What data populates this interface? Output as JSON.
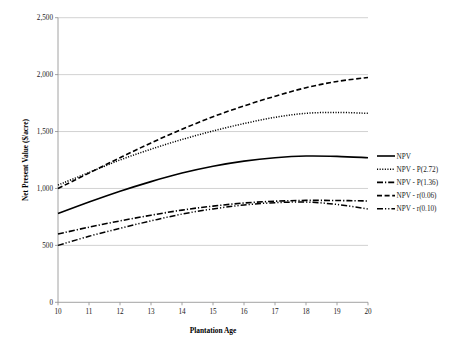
{
  "chart_data": {
    "type": "line",
    "title": "",
    "xlabel": "Plantation Age",
    "ylabel": "Net Present Value ($/acre)",
    "xlim": [
      10,
      20
    ],
    "ylim": [
      0,
      2500
    ],
    "x": [
      10,
      11,
      12,
      13,
      14,
      15,
      16,
      17,
      18,
      19,
      20
    ],
    "xticks": [
      "10",
      "11",
      "12",
      "13",
      "14",
      "15",
      "16",
      "17",
      "18",
      "19",
      "20"
    ],
    "yticks": [
      "0",
      "500",
      "1,000",
      "1,500",
      "2,000",
      "2,500"
    ],
    "ytick_values": [
      0,
      500,
      1000,
      1500,
      2000,
      2500
    ],
    "grid": "horizontal",
    "legend_position": "right",
    "series": [
      {
        "name": "NPV",
        "style": "solid",
        "values": [
          780,
          880,
          975,
          1060,
          1135,
          1195,
          1240,
          1270,
          1285,
          1282,
          1270
        ]
      },
      {
        "name": "NPV - P(2.72)",
        "style": "dotted",
        "values": [
          1030,
          1140,
          1250,
          1345,
          1430,
          1505,
          1570,
          1625,
          1660,
          1668,
          1660
        ]
      },
      {
        "name": "NPV - P(1.36)",
        "style": "dash-dot",
        "values": [
          600,
          660,
          715,
          765,
          810,
          845,
          872,
          888,
          895,
          894,
          890
        ]
      },
      {
        "name": "NPV - r(0.06)",
        "style": "dashed",
        "values": [
          1000,
          1135,
          1270,
          1400,
          1520,
          1630,
          1725,
          1810,
          1885,
          1940,
          1975
        ]
      },
      {
        "name": "NPV - r(0.10)",
        "style": "dash-dot-dot",
        "values": [
          500,
          580,
          650,
          715,
          775,
          820,
          855,
          875,
          880,
          860,
          820
        ]
      }
    ]
  },
  "legend": {
    "entries": [
      {
        "label": "NPV"
      },
      {
        "label": "NPV - P(2.72)"
      },
      {
        "label": "NPV - P(1.36)"
      },
      {
        "label": "NPV - r(0.06)"
      },
      {
        "label": "NPV - r(0.10)"
      }
    ]
  }
}
